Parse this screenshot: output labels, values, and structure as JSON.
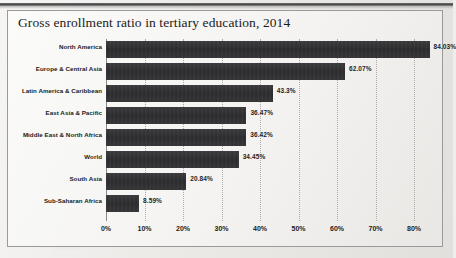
{
  "chart_data": {
    "type": "bar",
    "orientation": "horizontal",
    "title": "Gross enrollment ratio in tertiary education, 2014",
    "xlabel": "",
    "ylabel": "",
    "xlim": [
      0,
      80
    ],
    "xtick_labels": [
      "0%",
      "10%",
      "20%",
      "30%",
      "40%",
      "50%",
      "60%",
      "70%",
      "80%"
    ],
    "xtick_values": [
      0,
      10,
      20,
      30,
      40,
      50,
      60,
      70,
      80
    ],
    "grid": true,
    "legend": false,
    "bar_color": "#2f2f31",
    "categories": [
      "North America",
      "Europe & Central Asia",
      "Latin America & Caribbean",
      "East Asia & Pacific",
      "Middle East & North Africa",
      "World",
      "South Asia",
      "Sub-Saharan Africa"
    ],
    "values": [
      84.03,
      62.07,
      43.3,
      36.47,
      36.42,
      34.45,
      20.84,
      8.59
    ],
    "value_labels": [
      "84.03%",
      "62.07%",
      "43.3%",
      "36.47%",
      "36.42%",
      "34.45%",
      "20.84%",
      "8.59%"
    ]
  }
}
